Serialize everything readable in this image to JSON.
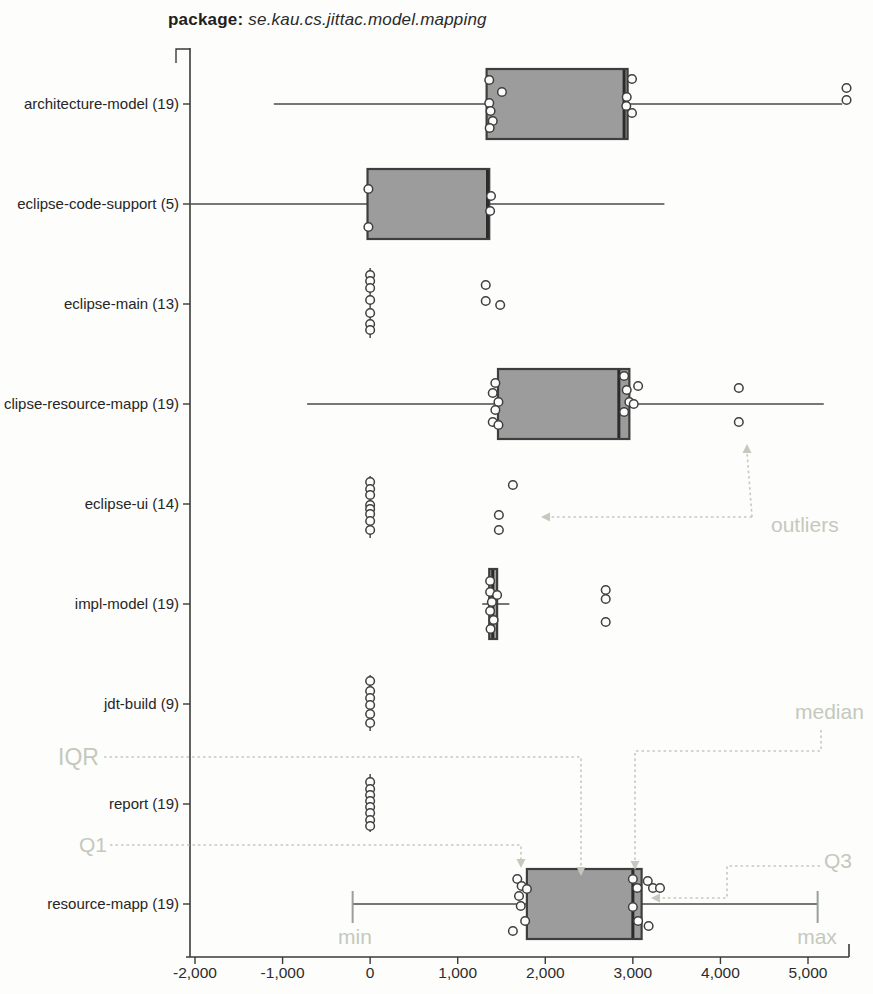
{
  "title": {
    "prefix": "package:",
    "package_name": "se.kau.cs.jittac.model.mapping"
  },
  "chart_data": {
    "type": "boxplot",
    "orientation": "horizontal",
    "xlabel": "",
    "ylabel": "",
    "x_axis": {
      "min": -2000,
      "max": 5000,
      "tick_step": 1000,
      "ticks": [
        -2000,
        -1000,
        0,
        1000,
        2000,
        3000,
        4000,
        5000
      ],
      "tick_labels": [
        "-2,000",
        "-1,000",
        "0",
        "1,000",
        "2,000",
        "3,000",
        "4,000",
        "5,000"
      ]
    },
    "rows": [
      {
        "label": "architecture-model (19)",
        "n": 19,
        "whisker_low": -1100,
        "q1": 1330,
        "median": 2900,
        "q3": 2940,
        "whisker_high": 5390,
        "points": [
          [
            1360,
            -24
          ],
          [
            1505,
            -12
          ],
          [
            1360,
            -1
          ],
          [
            1375,
            7
          ],
          [
            1400,
            17
          ],
          [
            1365,
            24
          ],
          [
            2990,
            -25
          ],
          [
            2930,
            -7
          ],
          [
            2925,
            2
          ],
          [
            2990,
            9
          ]
        ],
        "outliers": [
          [
            5440,
            -16
          ],
          [
            5440,
            -4
          ]
        ]
      },
      {
        "label": "eclipse-code-support (5)",
        "n": 5,
        "whisker_low": -2050,
        "q1": -30,
        "median": 1340,
        "q3": 1360,
        "whisker_high": 3360,
        "points": [
          [
            -20,
            -15
          ],
          [
            -20,
            23
          ],
          [
            1380,
            -8
          ],
          [
            1370,
            7
          ]
        ],
        "outliers": []
      },
      {
        "label": "eclipse-main (13)",
        "n": 13,
        "stem": {
          "x": 0,
          "dy_top": -36,
          "dy_bottom": 34
        },
        "points": [
          [
            0,
            -29
          ],
          [
            0,
            -23
          ],
          [
            0,
            -16
          ],
          [
            0,
            -4
          ],
          [
            0,
            9
          ],
          [
            0,
            20
          ],
          [
            0,
            26
          ]
        ],
        "outliers": [
          [
            1320,
            -19
          ],
          [
            1320,
            -3
          ],
          [
            1485,
            1
          ]
        ]
      },
      {
        "label": "clipse-resource-mapp (19)",
        "n": 19,
        "whisker_low": -720,
        "q1": 1460,
        "median": 2840,
        "q3": 2960,
        "whisker_high": 5180,
        "points": [
          [
            1430,
            -21
          ],
          [
            1400,
            -11
          ],
          [
            1465,
            -2
          ],
          [
            1430,
            6
          ],
          [
            1400,
            18
          ],
          [
            1465,
            21
          ],
          [
            2900,
            -28
          ],
          [
            2930,
            -14
          ],
          [
            2960,
            -2
          ],
          [
            3010,
            0
          ],
          [
            2900,
            8
          ]
        ],
        "outliers": [
          [
            3060,
            -18
          ],
          [
            4210,
            -16
          ],
          [
            4210,
            18
          ]
        ]
      },
      {
        "label": "eclipse-ui (14)",
        "n": 14,
        "stem": {
          "x": 0,
          "dy_top": -28,
          "dy_bottom": 34
        },
        "points": [
          [
            0,
            -22
          ],
          [
            0,
            -15
          ],
          [
            0,
            -9
          ],
          [
            0,
            1
          ],
          [
            0,
            5
          ],
          [
            0,
            10
          ],
          [
            0,
            17
          ],
          [
            0,
            26
          ]
        ],
        "outliers": [
          [
            1630,
            -19
          ],
          [
            1470,
            11
          ],
          [
            1470,
            26
          ]
        ]
      },
      {
        "label": "impl-model (19)",
        "n": 19,
        "whisker_low": 1280,
        "q1": 1360,
        "median": 1400,
        "q3": 1450,
        "whisker_high": 1590,
        "points": [
          [
            1370,
            -23
          ],
          [
            1370,
            -12
          ],
          [
            1450,
            -9
          ],
          [
            1390,
            -2
          ],
          [
            1370,
            7
          ],
          [
            1410,
            16
          ],
          [
            1375,
            25
          ]
        ],
        "outliers": [
          [
            2690,
            -14
          ],
          [
            2690,
            -5
          ],
          [
            2690,
            18
          ]
        ]
      },
      {
        "label": "jdt-build (9)",
        "n": 9,
        "stem": {
          "x": 0,
          "dy_top": -29,
          "dy_bottom": 27
        },
        "points": [
          [
            0,
            -23
          ],
          [
            0,
            -13
          ],
          [
            0,
            -6
          ],
          [
            0,
            1
          ],
          [
            0,
            10
          ],
          [
            0,
            19
          ]
        ],
        "outliers": []
      },
      {
        "label": "report (19)",
        "n": 19,
        "stem": {
          "x": 0,
          "dy_top": -30,
          "dy_bottom": 28
        },
        "points": [
          [
            0,
            -22
          ],
          [
            0,
            -15
          ],
          [
            0,
            -9
          ],
          [
            0,
            -3
          ],
          [
            0,
            3
          ],
          [
            0,
            9
          ],
          [
            0,
            16
          ],
          [
            0,
            22
          ]
        ],
        "outliers": []
      },
      {
        "label": "resource-mapp (19)",
        "n": 19,
        "whisker_low": -200,
        "q1": 1790,
        "median": 3000,
        "q3": 3100,
        "whisker_high": 5110,
        "caps": true,
        "points": [
          [
            1680,
            -25
          ],
          [
            1730,
            -18
          ],
          [
            1790,
            -15
          ],
          [
            1700,
            -8
          ],
          [
            1720,
            2
          ],
          [
            1770,
            17
          ],
          [
            3000,
            -25
          ],
          [
            3050,
            -16
          ],
          [
            3000,
            3
          ],
          [
            3060,
            17
          ],
          [
            3170,
            -23
          ],
          [
            3230,
            -16
          ],
          [
            3180,
            22
          ],
          [
            3310,
            -16
          ]
        ],
        "outliers": [
          [
            1630,
            27
          ]
        ]
      }
    ],
    "annotations": {
      "labels": [
        {
          "id": "outliers",
          "text": "outliers",
          "x": 771,
          "y": 532,
          "anchor": "start",
          "size": 21
        },
        {
          "id": "median",
          "text": "median",
          "x": 795,
          "y": 719,
          "anchor": "start",
          "size": 21
        },
        {
          "id": "iqr",
          "text": "IQR",
          "x": 58,
          "y": 765,
          "anchor": "start",
          "size": 23
        },
        {
          "id": "q1",
          "text": "Q1",
          "x": 79,
          "y": 852,
          "anchor": "start",
          "size": 21
        },
        {
          "id": "q3",
          "text": "Q3",
          "x": 824,
          "y": 868,
          "anchor": "start",
          "size": 21
        },
        {
          "id": "min",
          "text": "min",
          "x": 355,
          "y": 944,
          "anchor": "middle",
          "size": 21
        },
        {
          "id": "max",
          "text": "max",
          "x": 817,
          "y": 944,
          "anchor": "middle",
          "size": 21
        }
      ],
      "arrows": [
        {
          "id": "outliers-left",
          "path": [
            [
              752,
              517
            ],
            [
              549,
              517
            ]
          ],
          "head": "left"
        },
        {
          "id": "outliers-up",
          "path": [
            [
              752,
              517
            ],
            [
              747,
              452
            ]
          ],
          "head": "up"
        },
        {
          "id": "median-down",
          "path": [
            [
              821,
              730
            ],
            [
              821,
              751
            ],
            [
              635,
              751
            ],
            [
              635,
              862
            ]
          ],
          "head": "down"
        },
        {
          "id": "iqr-down",
          "path": [
            [
              104,
              757
            ],
            [
              581,
              757
            ],
            [
              581,
              868
            ]
          ],
          "head": "down"
        },
        {
          "id": "q1-down",
          "path": [
            [
              110,
              845
            ],
            [
              521,
              845
            ],
            [
              521,
              860
            ]
          ],
          "head": "down"
        },
        {
          "id": "q3-left",
          "path": [
            [
              820,
              866
            ],
            [
              727,
              866
            ],
            [
              727,
              898
            ],
            [
              659,
              898
            ]
          ],
          "head": "left"
        }
      ]
    },
    "colors": {
      "box_fill": "#9c9c9c",
      "box_stroke": "#3e3e3e",
      "median": "#2b2b2b",
      "whisker": "#4a4a4a",
      "cap": "#9aa097",
      "point_fill": "#fcfcfc",
      "point_stroke": "#3f3f3f",
      "axis": "#3a3a3a",
      "annotation": "#c4c9bd"
    }
  }
}
